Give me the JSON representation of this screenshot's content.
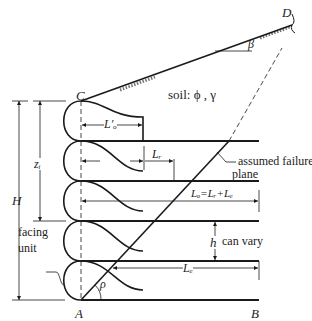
{
  "labels": {
    "point_c": "C",
    "point_d": "D",
    "point_a": "A",
    "point_b": "B",
    "beta": "β",
    "rho": "ρ",
    "soil": "soil: ϕ , γ",
    "h_total": "H",
    "z_i": "zᵢ",
    "lo_prime": "L′ₒ",
    "l_r": "Lᵣ",
    "l_total": "Lₒ=Lᵣ+Lₑ",
    "l_e": "Lₑ",
    "h_spacing": "h",
    "can_vary": "can vary",
    "failure_plane_line1": "assumed failure",
    "failure_plane_line2": "plane",
    "facing_line1": "facing",
    "facing_line2": "unit"
  },
  "colors": {
    "stroke": "#1a1a1a",
    "text": "#222222"
  }
}
